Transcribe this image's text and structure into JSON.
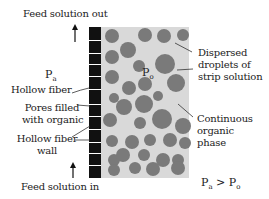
{
  "labels": {
    "feed_out": "Feed solution out",
    "feed_in": "Feed solution in",
    "hollow_fiber": "Hollow fiber",
    "pores_line1": "Pores filled",
    "pores_line2": "with organic",
    "wall_line1": "Hollow fiber",
    "wall_line2": "wall",
    "dispersed_line1": "Dispersed",
    "dispersed_line2": "droplets of",
    "dispersed_line3": "strip solution",
    "continuous_line1": "Continuous",
    "continuous_line2": "organic",
    "continuous_line3": "phase"
  },
  "symbols": {
    "pa_main": "P",
    "pa_sub": "a",
    "po_main": "P",
    "po_sub": "o",
    "relation_left_main": "P",
    "relation_left_sub": "a",
    "relation_op": " > ",
    "relation_right_main": "P",
    "relation_right_sub": "o"
  },
  "colors": {
    "wall": "#111111",
    "organic_phase": "#d9d9d9",
    "droplet": "#7a7a7a",
    "text": "#222222"
  }
}
